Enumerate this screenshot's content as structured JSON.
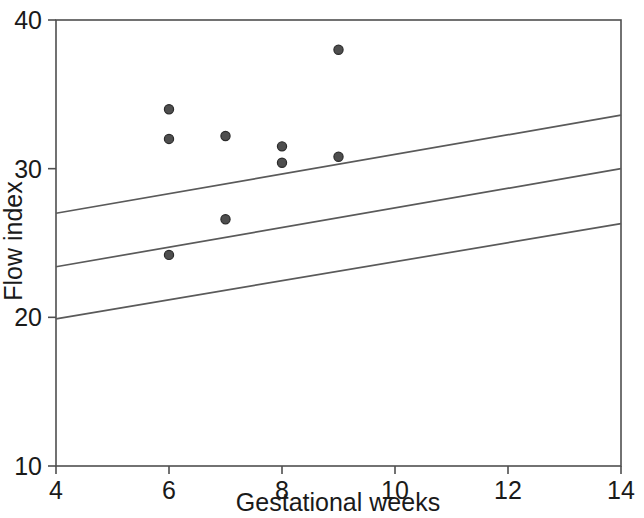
{
  "chart_data": {
    "type": "scatter",
    "title": "",
    "subtitle": "",
    "xlabel": "Gestational weeks",
    "ylabel": "Flow index",
    "xlim": [
      4,
      14
    ],
    "ylim": [
      10,
      40
    ],
    "xticks": [
      4,
      6,
      8,
      10,
      12,
      14
    ],
    "yticks": [
      10,
      20,
      30,
      40
    ],
    "xtick_labels": [
      "4",
      "6",
      "8",
      "10",
      "12",
      "14"
    ],
    "ytick_labels": [
      "10",
      "20",
      "30",
      "40"
    ],
    "grid": false,
    "legend": null,
    "legend_position": "none",
    "frame": "box",
    "marker_color": "#4e4e4e",
    "marker_edge_color": "#2b2b2b",
    "line_color": "#5a5a5a",
    "axis_color": "#4f4f4f",
    "background_color": "#ffffff",
    "points": [
      {
        "x": 6,
        "y": 34.0
      },
      {
        "x": 6,
        "y": 32.0
      },
      {
        "x": 6,
        "y": 24.2
      },
      {
        "x": 7,
        "y": 32.2
      },
      {
        "x": 7,
        "y": 26.6
      },
      {
        "x": 8,
        "y": 31.5
      },
      {
        "x": 8,
        "y": 30.4
      },
      {
        "x": 9,
        "y": 38.0
      },
      {
        "x": 9,
        "y": 30.8
      }
    ],
    "series": [
      {
        "name": "upper confidence band",
        "type": "line",
        "x": [
          4,
          14
        ],
        "values": [
          27.0,
          33.6
        ]
      },
      {
        "name": "regression fit",
        "type": "line",
        "x": [
          4,
          14
        ],
        "values": [
          23.4,
          30.0
        ]
      },
      {
        "name": "lower confidence band",
        "type": "line",
        "x": [
          4,
          14
        ],
        "values": [
          19.9,
          26.3
        ]
      }
    ],
    "annotations": []
  }
}
